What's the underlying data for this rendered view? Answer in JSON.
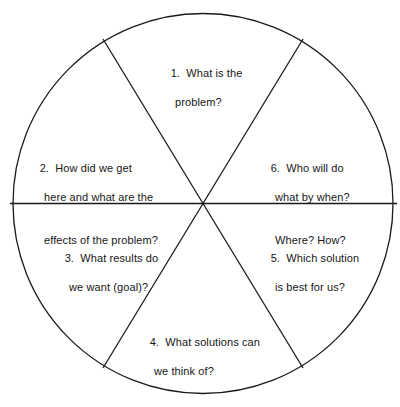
{
  "figure": {
    "kind": "problem-solving-wheel",
    "shape": "circle divided into six sectors",
    "stroke_color": "#1a1a1a",
    "text_color": "#161616",
    "background_color": "#ffffff"
  },
  "sectors": [
    {
      "number": "1.",
      "lines": [
        "What is the",
        "problem?"
      ],
      "position": "top"
    },
    {
      "number": "2.",
      "lines": [
        "How did we get",
        "here and what are the",
        "effects of the problem?"
      ],
      "position": "upper-left"
    },
    {
      "number": "3.",
      "lines": [
        "What results do",
        "we want (goal)?"
      ],
      "position": "lower-left"
    },
    {
      "number": "4.",
      "lines": [
        "What solutions can",
        "we think of?"
      ],
      "position": "bottom"
    },
    {
      "number": "5.",
      "lines": [
        "Which solution",
        "is best for us?"
      ],
      "position": "lower-right"
    },
    {
      "number": "6.",
      "lines": [
        "Who will do",
        "what by when?",
        "Where? How?"
      ],
      "position": "upper-right"
    }
  ]
}
